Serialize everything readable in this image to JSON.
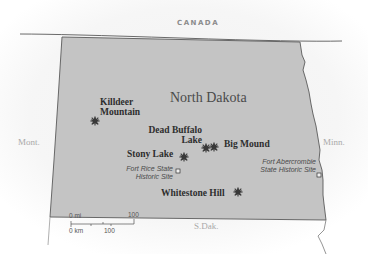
{
  "map": {
    "state_name": "North Dakota",
    "neighbors": {
      "north": "CANADA",
      "west": "Mont.",
      "east": "Minn.",
      "south": "S.Dak."
    },
    "battles": [
      {
        "name_line1": "Killdeer",
        "name_line2": "Mountain",
        "icon": "battle-star-icon"
      },
      {
        "name_line1": "Dead Buffalo",
        "name_line2": "Lake",
        "icon": "battle-star-icon"
      },
      {
        "name_line1": "Big Mound",
        "icon": "battle-star-icon"
      },
      {
        "name_line1": "Stony Lake",
        "icon": "battle-star-icon"
      },
      {
        "name_line1": "Whitestone Hill",
        "icon": "battle-star-icon"
      }
    ],
    "sites": [
      {
        "name_line1": "Fort Rice State",
        "name_line2": "Historic Site",
        "icon": "site-square-icon"
      },
      {
        "name_line1": "Fort Abercrombie",
        "name_line2": "State Historic Site",
        "icon": "site-square-icon"
      }
    ],
    "scale": {
      "mi_zero": "0 mi",
      "mi_max": "100",
      "km_zero": "0 km",
      "km_mid": "100"
    },
    "colors": {
      "state_fill": "#c4c4c4",
      "border": "#5a5a5a",
      "label": "#2e2e2e",
      "background": "#ffffff"
    }
  }
}
